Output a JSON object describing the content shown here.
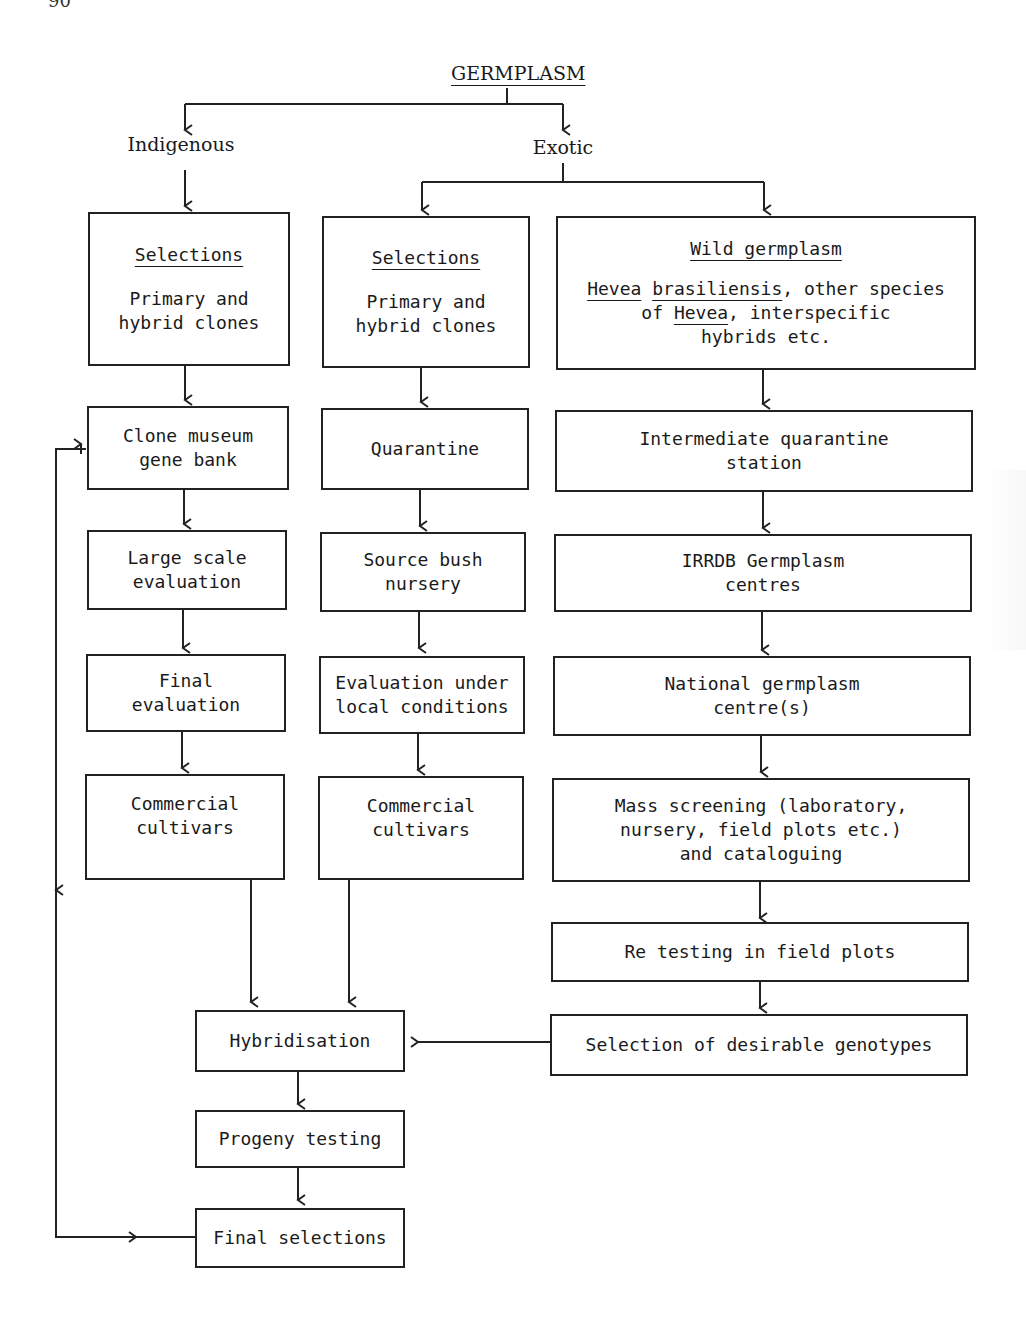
{
  "page_number": "90",
  "root": {
    "label": "GERMPLASM"
  },
  "branches": {
    "left": "Indigenous",
    "right": "Exotic"
  },
  "columns": {
    "indigenous": [
      {
        "id": "ind-selections",
        "title": "Selections",
        "lines": [
          "Primary and",
          "hybrid clones"
        ]
      },
      {
        "id": "clone-museum",
        "lines": [
          "Clone museum",
          "gene bank"
        ]
      },
      {
        "id": "large-scale",
        "lines": [
          "Large scale",
          "evaluation"
        ]
      },
      {
        "id": "final-eval",
        "lines": [
          "Final",
          "evaluation"
        ]
      },
      {
        "id": "ind-commercial",
        "lines": [
          "Commercial",
          "cultivars"
        ]
      }
    ],
    "exotic": [
      {
        "id": "exo-selections",
        "title": "Selections",
        "lines": [
          "Primary and",
          "hybrid clones"
        ]
      },
      {
        "id": "quarantine",
        "lines": [
          "Quarantine"
        ]
      },
      {
        "id": "source-bush",
        "lines": [
          "Source bush",
          "nursery"
        ]
      },
      {
        "id": "eval-local",
        "lines": [
          "Evaluation under",
          "local conditions"
        ]
      },
      {
        "id": "exo-commercial",
        "lines": [
          "Commercial",
          "cultivars"
        ]
      }
    ],
    "wild": [
      {
        "id": "wild-germplasm",
        "title": "Wild germplasm",
        "lines": [
          "Hevea brasiliensis, other species",
          "of Hevea, interspecific",
          "hybrids etc."
        ],
        "underlined_terms": [
          "Hevea",
          "brasiliensis",
          "Hevea"
        ]
      },
      {
        "id": "intermediate-quarantine",
        "lines": [
          "Intermediate quarantine",
          "station"
        ]
      },
      {
        "id": "irrdb",
        "lines": [
          "IRRDB Germplasm",
          "centres"
        ]
      },
      {
        "id": "national",
        "lines": [
          "National germplasm",
          "centre(s)"
        ]
      },
      {
        "id": "mass-screening",
        "lines": [
          "Mass screening (laboratory,",
          "nursery, field plots etc.)",
          "and cataloguing"
        ]
      },
      {
        "id": "retesting",
        "lines": [
          "Re testing in field plots"
        ]
      },
      {
        "id": "selection-desirable",
        "lines": [
          "Selection of desirable genotypes"
        ]
      }
    ]
  },
  "bottom": [
    {
      "id": "hybridisation",
      "lines": [
        "Hybridisation"
      ]
    },
    {
      "id": "progeny",
      "lines": [
        "Progeny testing"
      ]
    },
    {
      "id": "final-selections",
      "lines": [
        "Final selections"
      ]
    }
  ]
}
